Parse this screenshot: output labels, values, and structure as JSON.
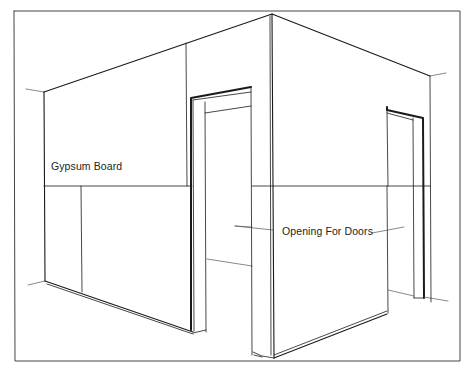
{
  "figure": {
    "type": "perspective illustration"
  },
  "labels": {
    "gypsum_board": "Gypsum Board",
    "opening_for_doors": "Opening For Doors"
  },
  "colors": {
    "line": "#1a1a1a",
    "background": "#ffffff",
    "frame": "#444444"
  }
}
